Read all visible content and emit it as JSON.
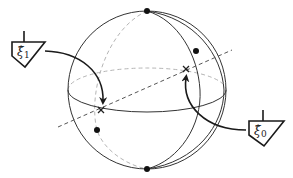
{
  "diagram": {
    "type": "bloch-sphere-antipodal-points",
    "colors": {
      "front_lines": "#333333",
      "back_lines": "#b5b5b5",
      "axis_dashed": "#555555",
      "arrows": "#1a1a1a",
      "dots": "#111111"
    },
    "sphere": {
      "cx": 147,
      "cy": 90,
      "r": 79
    },
    "poles": [
      {
        "name": "north-pole",
        "x": 147,
        "y": 11
      },
      {
        "name": "south-pole",
        "x": 147,
        "y": 169
      }
    ],
    "extra_points": [
      {
        "name": "meridian-point-upper-right",
        "x": 196,
        "y": 51
      },
      {
        "name": "meridian-point-lower-left",
        "x": 97,
        "y": 130
      }
    ],
    "cross_marks": [
      {
        "name": "xi1-point",
        "x": 101,
        "y": 110
      },
      {
        "name": "xi0-point",
        "x": 186,
        "y": 69
      }
    ],
    "labels": [
      {
        "name": "xi1-label",
        "symbol": "ξ̂",
        "subscript": "1"
      },
      {
        "name": "xi0-label",
        "symbol": "ξ̂",
        "subscript": "0"
      }
    ]
  }
}
